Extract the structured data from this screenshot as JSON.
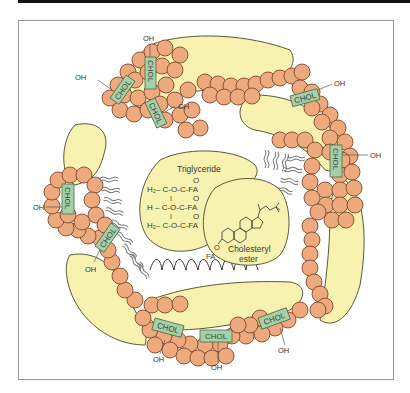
{
  "figure": {
    "colors": {
      "phospholipid_head": "#eeaa7c",
      "phospholipid_outline": "#7a4a30",
      "apoprotein_fill": "#f8f2b0",
      "apoprotein_outline": "#5a5a3a",
      "cholesterol_fill": "#a8d0a8",
      "cholesterol_outline": "#4a6a4a",
      "frame": "#9a9a9a",
      "top_rule": "#111111"
    },
    "cholesterol_label": "CHOL",
    "hydroxyl_label": "OH",
    "core": {
      "triglyceride": {
        "title": "Triglyceride",
        "lines": [
          "H₂– C-O-C-FA",
          "H – C-O-C-FA",
          "H₂– C-O-C-FA"
        ],
        "carbonyl": "O",
        "bond": "I"
      },
      "cholesteryl_ester": {
        "title_line1": "Cholesteryl",
        "title_line2": "ester",
        "fa_label": "FA",
        "o_label": "O"
      }
    }
  }
}
